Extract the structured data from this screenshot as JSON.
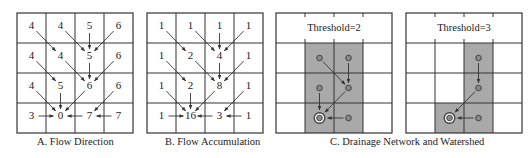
{
  "grid": {
    "rows": 4,
    "cols": 4
  },
  "colors": {
    "line": "#333333",
    "shade": "#a9a9a9",
    "node_fill": "#8a8a8a",
    "node_stroke": "#444444",
    "outlet_ring": "#ffffff",
    "arrow": "#333333",
    "text": "#222222"
  },
  "panels": [
    {
      "id": "A",
      "type": "values",
      "x": 17,
      "values": [
        [
          4,
          4,
          5,
          6
        ],
        [
          4,
          4,
          5,
          6
        ],
        [
          4,
          5,
          6,
          6
        ],
        [
          3,
          0,
          7,
          7
        ]
      ]
    },
    {
      "id": "B",
      "type": "values",
      "x": 147,
      "values": [
        [
          1,
          1,
          1,
          1
        ],
        [
          1,
          2,
          4,
          1
        ],
        [
          1,
          2,
          8,
          1
        ],
        [
          1,
          16,
          3,
          1
        ]
      ]
    },
    {
      "id": "C1",
      "type": "network",
      "x": 276,
      "threshold_label": "Threshold=2",
      "shaded": [
        [
          1,
          1
        ],
        [
          1,
          2
        ],
        [
          2,
          1
        ],
        [
          2,
          2
        ],
        [
          3,
          1
        ],
        [
          3,
          2
        ]
      ],
      "nodes": [
        [
          1,
          1
        ],
        [
          1,
          2
        ],
        [
          2,
          1
        ],
        [
          2,
          2
        ],
        [
          3,
          2
        ]
      ],
      "outlet": [
        3,
        1
      ],
      "edges": [
        [
          [
            1,
            1
          ],
          [
            2,
            2
          ]
        ],
        [
          [
            1,
            2
          ],
          [
            2,
            2
          ]
        ],
        [
          [
            2,
            1
          ],
          [
            3,
            1
          ]
        ],
        [
          [
            2,
            2
          ],
          [
            3,
            1
          ]
        ],
        [
          [
            3,
            2
          ],
          [
            3,
            1
          ]
        ]
      ]
    },
    {
      "id": "C2",
      "type": "network",
      "x": 406,
      "threshold_label": "Threshold=3",
      "shaded": [
        [
          1,
          2
        ],
        [
          2,
          2
        ],
        [
          3,
          1
        ],
        [
          3,
          2
        ]
      ],
      "nodes": [
        [
          1,
          2
        ],
        [
          2,
          2
        ],
        [
          3,
          2
        ]
      ],
      "outlet": [
        3,
        1
      ],
      "edges": [
        [
          [
            1,
            2
          ],
          [
            2,
            2
          ]
        ],
        [
          [
            2,
            2
          ],
          [
            3,
            1
          ]
        ],
        [
          [
            3,
            2
          ],
          [
            3,
            1
          ]
        ]
      ]
    }
  ],
  "flow_edges": [
    [
      [
        0,
        0
      ],
      [
        1,
        1
      ]
    ],
    [
      [
        0,
        1
      ],
      [
        1,
        2
      ]
    ],
    [
      [
        0,
        2
      ],
      [
        1,
        2
      ]
    ],
    [
      [
        0,
        3
      ],
      [
        1,
        2
      ]
    ],
    [
      [
        1,
        0
      ],
      [
        2,
        1
      ]
    ],
    [
      [
        1,
        1
      ],
      [
        2,
        2
      ]
    ],
    [
      [
        1,
        2
      ],
      [
        2,
        2
      ]
    ],
    [
      [
        1,
        3
      ],
      [
        2,
        2
      ]
    ],
    [
      [
        2,
        0
      ],
      [
        3,
        1
      ]
    ],
    [
      [
        2,
        1
      ],
      [
        3,
        1
      ]
    ],
    [
      [
        2,
        2
      ],
      [
        3,
        1
      ]
    ],
    [
      [
        2,
        3
      ],
      [
        3,
        2
      ]
    ],
    [
      [
        3,
        0
      ],
      [
        3,
        1
      ]
    ],
    [
      [
        3,
        2
      ],
      [
        3,
        1
      ]
    ],
    [
      [
        3,
        3
      ],
      [
        3,
        2
      ]
    ]
  ],
  "captions": {
    "a": "A. Flow Direction",
    "b": "B. Flow Accumulation",
    "c": "C. Drainage Network and Watershed"
  }
}
